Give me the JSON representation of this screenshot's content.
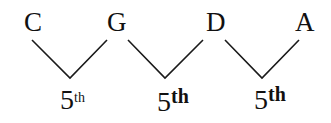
{
  "diagram": {
    "title": "",
    "notes": [
      {
        "label": "C",
        "x": 24,
        "y": 9
      },
      {
        "label": "G",
        "x": 107,
        "y": 9
      },
      {
        "label": "D",
        "x": 207,
        "y": 9
      },
      {
        "label": "A",
        "x": 296,
        "y": 9
      }
    ],
    "intervals": [
      {
        "from": "C",
        "to": "G",
        "number": "5",
        "suffix": "th",
        "x": 57,
        "y": 85
      },
      {
        "from": "G",
        "to": "D",
        "number": "5",
        "suffix": "th",
        "x": 157,
        "y": 87
      },
      {
        "from": "D",
        "to": "A",
        "number": "5",
        "suffix": "th",
        "x": 255,
        "y": 85
      }
    ],
    "line_color": "#1a1a1a"
  }
}
